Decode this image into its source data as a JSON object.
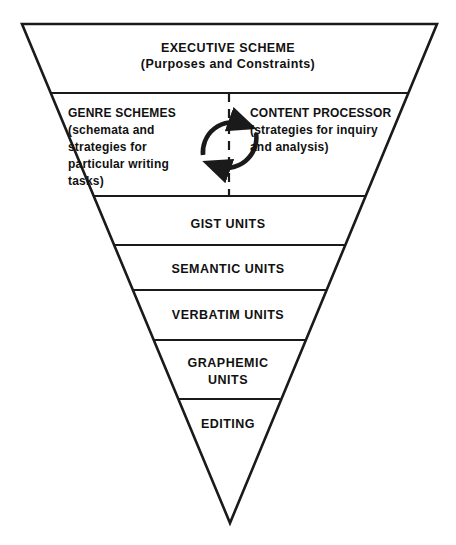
{
  "diagram": {
    "shape": "inverted-triangle",
    "stroke_color": "#1a1a1a",
    "background_color": "#ffffff",
    "text_color": "#111111",
    "geometry": {
      "apex_x": 230,
      "apex_y": 523,
      "top_left_x": 22,
      "top_right_x": 437,
      "top_y": 24,
      "divider_y": [
        93,
        196,
        245,
        290,
        340,
        399
      ]
    },
    "center_divider": {
      "name": "dashed-center-line",
      "style": "dashed",
      "x": 229,
      "y_start": 93,
      "y_end": 196
    },
    "cycle_arrows": {
      "name": "circular-exchange-arrows",
      "description": "Two curved arrows forming a clockwise cycle between the left and right halves of tier 2",
      "top_arrow_direction": "left-to-right",
      "bottom_arrow_direction": "right-to-left"
    },
    "tiers": [
      {
        "id": "executive-scheme",
        "label": "EXECUTIVE SCHEME\n(Purposes and Constraints)",
        "heading": "EXECUTIVE SCHEME",
        "subtitle": "(Purposes and Constraints)",
        "level": 1
      },
      {
        "id": "processing-tier",
        "level": 2,
        "split": true,
        "left": {
          "id": "genre-schemes",
          "heading": "GENRE SCHEMES",
          "subtitle": "(schemata and strategies for particular writing tasks)",
          "label": "GENRE SCHEMES\n(schemata and\nstrategies for\nparticular writing\ntasks)"
        },
        "right": {
          "id": "content-processor",
          "heading": "CONTENT PROCESSOR",
          "subtitle": "(strategies for inquiry and analysis)",
          "label": "CONTENT PROCESSOR\n(strategies for inquiry\nand analysis)"
        }
      },
      {
        "id": "gist-units",
        "label": "GIST UNITS",
        "level": 3
      },
      {
        "id": "semantic-units",
        "label": "SEMANTIC UNITS",
        "level": 4
      },
      {
        "id": "verbatim-units",
        "label": "VERBATIM UNITS",
        "level": 5
      },
      {
        "id": "graphemic-units",
        "label": "GRAPHEMIC\nUNITS",
        "level": 6
      },
      {
        "id": "editing",
        "label": "EDITING",
        "level": 7
      }
    ]
  }
}
